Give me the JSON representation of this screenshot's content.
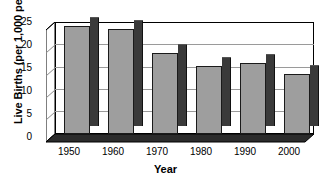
{
  "chart_data": {
    "type": "bar",
    "title": "",
    "xlabel": "Year",
    "ylabel": "Live Births (per 1,000 people)",
    "categories": [
      "1950",
      "1960",
      "1970",
      "1980",
      "1990",
      "2000"
    ],
    "values": [
      24,
      23.5,
      18,
      15.2,
      15.8,
      13.5
    ],
    "ylim": [
      0,
      25
    ],
    "yticks": [
      0,
      5,
      10,
      15,
      20,
      25
    ],
    "ytick_labels": [
      "0",
      "5",
      "10",
      "15",
      "20",
      "25"
    ],
    "grid": "horizontal",
    "legend": "none",
    "style": "3d-column",
    "colors": {
      "bar_face": "#9e9e9e",
      "bar_side": "#3a3a3a",
      "bar_top": "#555555",
      "gridline": "#9a9a9a",
      "axis": "#000000",
      "background": "#ffffff"
    }
  }
}
